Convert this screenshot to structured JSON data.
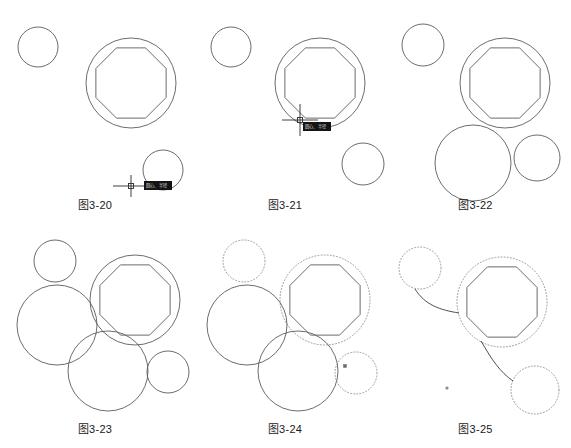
{
  "sheet": {
    "width": 571,
    "height": 448,
    "background": "#ffffff",
    "line_color": "#5a5a62",
    "dotted_color": "#8c8c96",
    "cursor_color": "#2b2b2b",
    "tooltip_bg": "#141414",
    "tooltip_fg": "#d8d8d8"
  },
  "panels": [
    {
      "id": "fig-3-20",
      "caption": "图3-20",
      "x": 0,
      "y": 0,
      "w": 190,
      "h": 224,
      "caption_y": 196,
      "shapes": {
        "small_circle_top_left": {
          "cx": 38,
          "cy": 47,
          "r": 20,
          "style": "solid"
        },
        "outer_circle": {
          "cx": 131,
          "cy": 83,
          "r": 45,
          "style": "solid"
        },
        "octagon": {
          "cx": 131,
          "cy": 83,
          "r": 38,
          "rotation_deg": 22.5,
          "sides": 8,
          "style": "solid"
        },
        "cursor_circle": {
          "cx": 163,
          "cy": 170,
          "r": 20,
          "style": "solid"
        }
      },
      "cursor": {
        "x": 131,
        "y": 186,
        "h_len": 36,
        "v_len": 22,
        "pickbox": 5,
        "tooltip": {
          "x": 144,
          "y": 181,
          "w": 28,
          "h": 9,
          "text": "圆心、半径"
        }
      }
    },
    {
      "id": "fig-3-21",
      "caption": "图3-21",
      "x": 190,
      "y": 0,
      "w": 190,
      "h": 224,
      "caption_y": 196,
      "shapes": {
        "small_circle_top_left": {
          "cx": 231,
          "cy": 47,
          "r": 20,
          "style": "solid"
        },
        "outer_circle": {
          "cx": 320,
          "cy": 83,
          "r": 45,
          "style": "solid"
        },
        "octagon": {
          "cx": 320,
          "cy": 83,
          "r": 38,
          "rotation_deg": 22.5,
          "sides": 8,
          "style": "solid"
        },
        "small_circle_bottom_right": {
          "cx": 363,
          "cy": 164,
          "r": 21,
          "style": "solid"
        }
      },
      "cursor": {
        "x": 300,
        "y": 120,
        "h_len": 36,
        "v_len": 32,
        "pickbox": 5,
        "tooltip": {
          "x": 303,
          "y": 122,
          "w": 28,
          "h": 9,
          "text": "圆心、半径"
        }
      }
    },
    {
      "id": "fig-3-22",
      "caption": "图3-22",
      "x": 380,
      "y": 0,
      "w": 191,
      "h": 224,
      "caption_y": 196,
      "shapes": {
        "small_circle_top_left": {
          "cx": 423,
          "cy": 45,
          "r": 21,
          "style": "solid"
        },
        "outer_circle": {
          "cx": 505,
          "cy": 83,
          "r": 45,
          "style": "solid"
        },
        "octagon": {
          "cx": 505,
          "cy": 83,
          "r": 38,
          "rotation_deg": 22.5,
          "sides": 8,
          "style": "solid"
        },
        "big_circle_bottom": {
          "cx": 473,
          "cy": 163,
          "r": 38,
          "style": "solid"
        },
        "small_circle_right": {
          "cx": 537,
          "cy": 158,
          "r": 23,
          "style": "solid"
        }
      }
    },
    {
      "id": "fig-3-23",
      "caption": "图3-23",
      "x": 0,
      "y": 224,
      "w": 190,
      "h": 224,
      "caption_y": 420,
      "shapes": {
        "small_circle_top": {
          "cx": 55,
          "cy": 261,
          "r": 21,
          "style": "solid"
        },
        "outer_circle": {
          "cx": 135,
          "cy": 300,
          "r": 45,
          "style": "solid"
        },
        "octagon": {
          "cx": 135,
          "cy": 300,
          "r": 38,
          "rotation_deg": 22.5,
          "sides": 8,
          "style": "solid"
        },
        "big_circle_left": {
          "cx": 57,
          "cy": 325,
          "r": 40,
          "style": "solid"
        },
        "big_circle_bottom": {
          "cx": 108,
          "cy": 371,
          "r": 40,
          "style": "solid"
        },
        "small_circle_right": {
          "cx": 168,
          "cy": 372,
          "r": 21,
          "style": "solid"
        }
      }
    },
    {
      "id": "fig-3-24",
      "caption": "图3-24",
      "x": 190,
      "y": 224,
      "w": 190,
      "h": 224,
      "caption_y": 420,
      "shapes": {
        "small_circle_top": {
          "cx": 244,
          "cy": 261,
          "r": 21,
          "style": "dotted"
        },
        "outer_circle": {
          "cx": 325,
          "cy": 300,
          "r": 45,
          "style": "dotted"
        },
        "octagon": {
          "cx": 325,
          "cy": 300,
          "r": 38,
          "rotation_deg": 22.5,
          "sides": 8,
          "style": "solid"
        },
        "big_circle_left": {
          "cx": 247,
          "cy": 325,
          "r": 40,
          "style": "solid"
        },
        "big_circle_bottom": {
          "cx": 298,
          "cy": 371,
          "r": 40,
          "style": "solid"
        },
        "small_circle_right": {
          "cx": 356,
          "cy": 373,
          "r": 21,
          "style": "dotted"
        }
      },
      "grips": [
        {
          "x": 345,
          "y": 366,
          "size": 3
        }
      ]
    },
    {
      "id": "fig-3-25",
      "caption": "图3-25",
      "x": 380,
      "y": 224,
      "w": 191,
      "h": 224,
      "caption_y": 420,
      "shapes": {
        "small_circle_top": {
          "cx": 420,
          "cy": 268,
          "r": 21,
          "style": "dotted"
        },
        "outer_circle": {
          "cx": 502,
          "cy": 302,
          "r": 45,
          "style": "dotted"
        },
        "octagon": {
          "cx": 502,
          "cy": 302,
          "r": 38,
          "rotation_deg": 22.5,
          "sides": 8,
          "style": "solid"
        },
        "small_circle_bottom_right": {
          "cx": 535,
          "cy": 390,
          "r": 24,
          "style": "dotted"
        }
      },
      "tangent_arcs": [
        {
          "from": "small_circle_top",
          "to": "outer_circle",
          "d": "M 415 289 C 425 305 440 310 459 313"
        },
        {
          "from": "outer_circle",
          "to": "small_circle_bottom_right",
          "d": "M 481 341 C 492 360 500 372 513 381"
        }
      ],
      "dot_markers": [
        {
          "cx": 447,
          "cy": 388,
          "r": 1.6
        }
      ]
    }
  ]
}
